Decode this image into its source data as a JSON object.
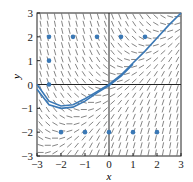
{
  "chart_data": {
    "type": "line",
    "title": "",
    "xlabel": "x",
    "ylabel": "y",
    "xlim": [
      -3,
      3
    ],
    "ylim": [
      -3,
      3
    ],
    "xticks": [
      "-3",
      "-2",
      "-1",
      "0",
      "1",
      "2",
      "3"
    ],
    "yticks": [
      "-3",
      "-2",
      "-1",
      "0",
      "1",
      "2",
      "3"
    ],
    "grid": false,
    "series": [
      {
        "name": "solution-1",
        "x": [
          -3,
          -2.5,
          -2,
          -1.5,
          -1,
          -0.5,
          0,
          0.5,
          1,
          1.5,
          2,
          2.5,
          3
        ],
        "y": [
          0,
          -0.7,
          -0.9,
          -0.85,
          -0.6,
          -0.3,
          0,
          0.4,
          0.9,
          1.4,
          1.95,
          2.5,
          3
        ]
      },
      {
        "name": "solution-2",
        "x": [
          -3,
          -2.5,
          -2,
          -1.5,
          -1,
          -0.5,
          0,
          0.5,
          1
        ],
        "y": [
          -0.2,
          -0.85,
          -1.0,
          -0.95,
          -0.7,
          -0.35,
          -0.05,
          0.35,
          0.85
        ]
      }
    ],
    "points": [
      [
        -2.5,
        2
      ],
      [
        -1.5,
        2
      ],
      [
        -0.5,
        2
      ],
      [
        0.5,
        2
      ],
      [
        1.5,
        2
      ],
      [
        -2.5,
        1
      ],
      [
        -2.5,
        0
      ],
      [
        -2,
        -2
      ],
      [
        -1,
        -2
      ],
      [
        0,
        -2
      ],
      [
        1,
        -2
      ],
      [
        2,
        -2
      ]
    ],
    "accent": "#3a78b5"
  }
}
